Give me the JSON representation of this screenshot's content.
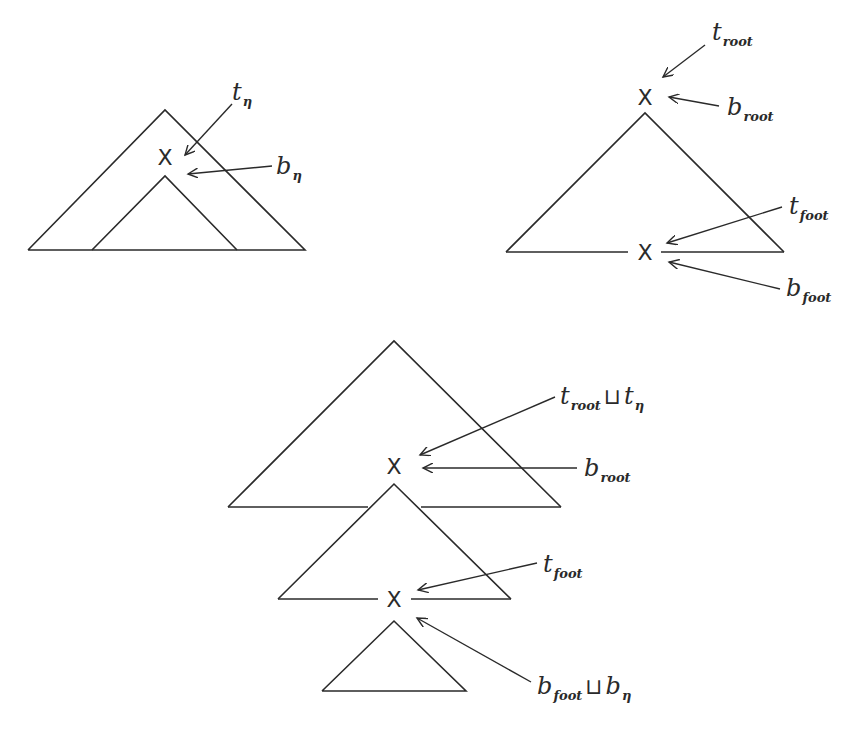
{
  "figure": {
    "node_label": "X",
    "join_symbol": "⊔",
    "left_tree": {
      "name": "tree-eta",
      "top_feature": {
        "base": "t",
        "sub": "η"
      },
      "bottom_feature": {
        "base": "b",
        "sub": "η"
      }
    },
    "right_tree": {
      "name": "auxiliary-tree",
      "root_top": {
        "base": "t",
        "sub": "root"
      },
      "root_bottom": {
        "base": "b",
        "sub": "root"
      },
      "foot_top": {
        "base": "t",
        "sub": "foot"
      },
      "foot_bottom": {
        "base": "b",
        "sub": "foot"
      }
    },
    "result_tree": {
      "name": "derived-tree",
      "root_top": {
        "a": {
          "base": "t",
          "sub": "root"
        },
        "b": {
          "base": "t",
          "sub": "η"
        }
      },
      "root_bottom": {
        "base": "b",
        "sub": "root"
      },
      "foot_top": {
        "base": "t",
        "sub": "foot"
      },
      "foot_bottom": {
        "a": {
          "base": "b",
          "sub": "foot"
        },
        "b": {
          "base": "b",
          "sub": "η"
        }
      }
    }
  }
}
